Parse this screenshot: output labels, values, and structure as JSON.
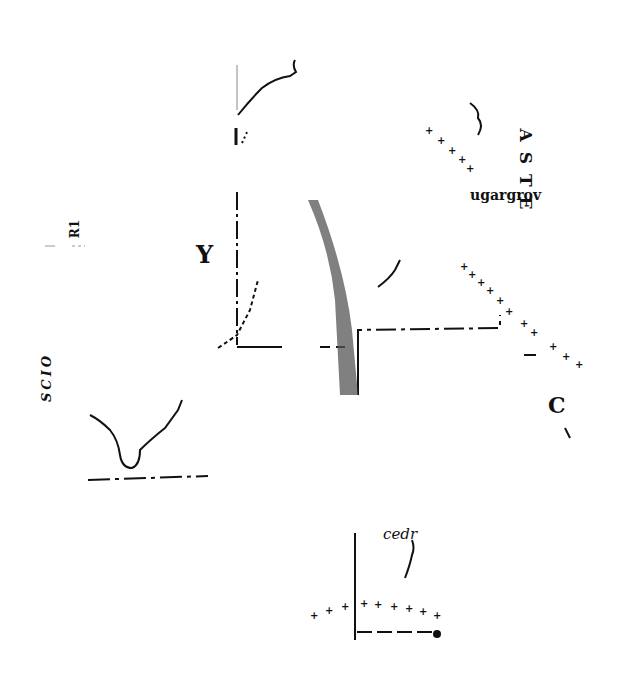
{
  "map": {
    "ink_color": "#111111",
    "paper_color": "#ffffff",
    "labels": {
      "y_letter": "Y",
      "r_fragment": "R1",
      "scio_fragment": "SCIO",
      "aste_fragment": "A S T E",
      "sugargrove": "ugargrov",
      "c_letter": "C",
      "cedar_fragment": "cedr"
    },
    "features": [
      {
        "type": "county-boundary",
        "style": "dash-dot"
      },
      {
        "type": "river",
        "style": "wavy-line"
      },
      {
        "type": "railroad",
        "style": "cross-ticks"
      },
      {
        "type": "stippled-strip",
        "style": "dotted-fill"
      }
    ]
  }
}
